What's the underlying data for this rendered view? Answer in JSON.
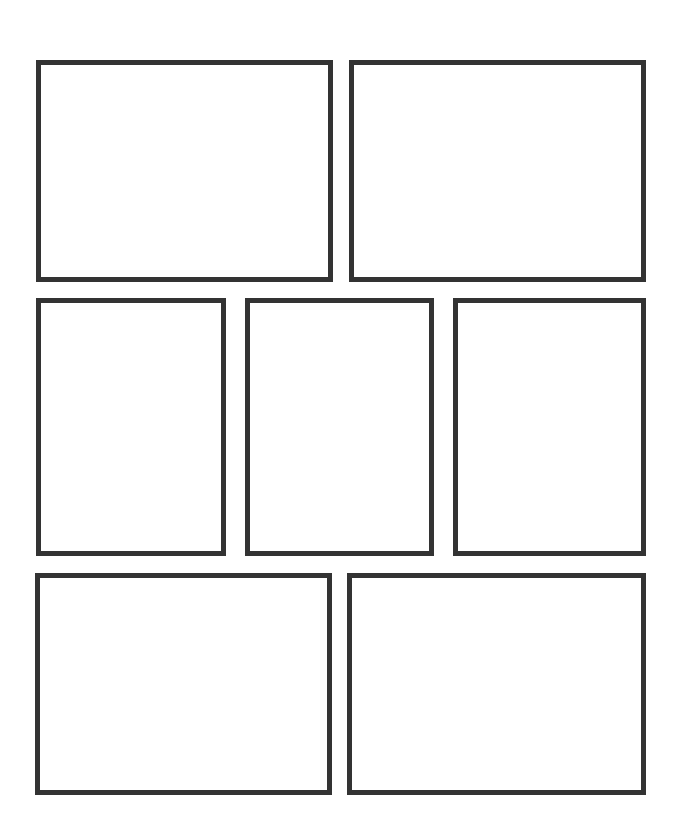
{
  "page": {
    "type": "comic-panel-layout-template",
    "background_color": "#ffffff",
    "border_color": "#333333",
    "rows": [
      {
        "row": 1,
        "panel_count": 2
      },
      {
        "row": 2,
        "panel_count": 3
      },
      {
        "row": 3,
        "panel_count": 2
      }
    ],
    "panels": [
      {
        "id": 1,
        "row": 1,
        "content": ""
      },
      {
        "id": 2,
        "row": 1,
        "content": ""
      },
      {
        "id": 3,
        "row": 2,
        "content": ""
      },
      {
        "id": 4,
        "row": 2,
        "content": ""
      },
      {
        "id": 5,
        "row": 2,
        "content": ""
      },
      {
        "id": 6,
        "row": 3,
        "content": ""
      },
      {
        "id": 7,
        "row": 3,
        "content": ""
      }
    ]
  }
}
